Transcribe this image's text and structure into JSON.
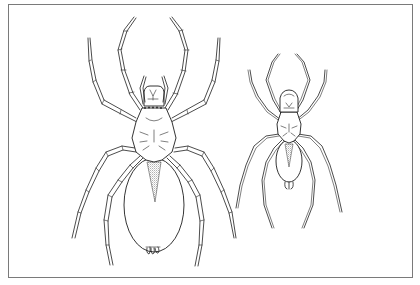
{
  "figure": {
    "frame_color": "#7a7a7a",
    "line_color": "#1e1e1e",
    "background": "#ffffff",
    "specimens": [
      {
        "id": "large-spider",
        "position": "left",
        "relative_size": "large"
      },
      {
        "id": "small-spider",
        "position": "right",
        "relative_size": "small"
      }
    ]
  }
}
